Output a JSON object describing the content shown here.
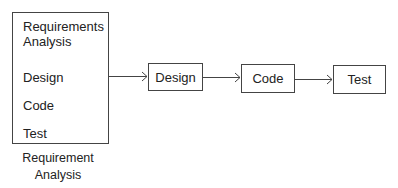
{
  "left_box": {
    "items": [
      "Requirements Analysis",
      "Design",
      "Code",
      "Test"
    ],
    "caption": "Requirement Analysis"
  },
  "flow": {
    "nodes": [
      "Design",
      "Code",
      "Test"
    ]
  }
}
